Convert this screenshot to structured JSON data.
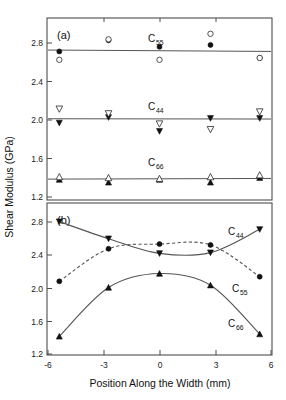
{
  "figure": {
    "ylabel": "Shear Modulus (GPa)",
    "xlabel": "Position Along the Width (mm)",
    "panel_a_label": "(a)",
    "panel_b_label": "(b)",
    "ytick_labels": [
      "2.8",
      "2.4",
      "2.0",
      "1.6",
      "1.2"
    ],
    "ytick_values": [
      2.8,
      2.4,
      2.0,
      1.6,
      1.2
    ],
    "xtick_labels": [
      "-6",
      "-3",
      "0",
      "3",
      "6"
    ],
    "xtick_values": [
      -6,
      -3,
      0,
      3,
      6
    ],
    "series_names": {
      "c55_base": "C",
      "c55_sub": "55",
      "c44_base": "C",
      "c44_sub": "44",
      "c66_base": "C",
      "c66_sub": "66"
    },
    "colors": {
      "axis": "#4d4d4d",
      "line": "#555555",
      "marker_filled": "#111111",
      "marker_open_fill": "#ffffff",
      "marker_open_stroke": "#333333",
      "background": "#ffffff"
    }
  },
  "chart_data": [
    {
      "type": "scatter",
      "panel": "(a)",
      "title": "",
      "xlabel": "",
      "ylabel": "Shear Modulus (GPa)",
      "xlim": [
        -6.4,
        6.4
      ],
      "ylim": [
        1.02,
        2.98
      ],
      "grid": false,
      "legend_position": "inline-annotations",
      "annotations": [
        "(a)",
        "C55",
        "C44",
        "C66"
      ],
      "x": [
        -5.7,
        -2.9,
        0.0,
        2.9,
        5.7
      ],
      "series": [
        {
          "name": "C55 filled",
          "marker": "filled-circle",
          "values": [
            2.62,
            2.74,
            2.67,
            2.69,
            2.55
          ]
        },
        {
          "name": "C55 open",
          "marker": "open-circle",
          "values": [
            2.53,
            2.75,
            2.53,
            2.81,
            2.55
          ]
        },
        {
          "name": "C55 fit",
          "marker": "line",
          "values": [
            2.635,
            2.63,
            2.627,
            2.624,
            2.62
          ]
        },
        {
          "name": "C44 filled",
          "marker": "filled-down-triangle",
          "values": [
            1.85,
            1.91,
            1.76,
            1.9,
            1.9
          ]
        },
        {
          "name": "C44 open",
          "marker": "open-down-triangle",
          "values": [
            2.0,
            1.95,
            1.84,
            1.78,
            1.97
          ]
        },
        {
          "name": "C44 fit",
          "marker": "line",
          "values": [
            1.895,
            1.895,
            1.894,
            1.893,
            1.892
          ]
        },
        {
          "name": "C66 filled",
          "marker": "filled-up-triangle",
          "values": [
            1.24,
            1.21,
            1.24,
            1.21,
            1.26
          ]
        },
        {
          "name": "C66 open",
          "marker": "open-up-triangle",
          "values": [
            1.27,
            1.26,
            1.25,
            1.27,
            1.29
          ]
        },
        {
          "name": "C66 fit",
          "marker": "line",
          "values": [
            1.245,
            1.247,
            1.248,
            1.25,
            1.252
          ]
        }
      ]
    },
    {
      "type": "line",
      "panel": "(b)",
      "title": "",
      "xlabel": "Position Along the Width (mm)",
      "ylabel": "Shear Modulus (GPa)",
      "xlim": [
        -6.4,
        6.4
      ],
      "ylim": [
        1.02,
        2.98
      ],
      "grid": false,
      "legend_position": "inline-annotations",
      "annotations": [
        "(b)",
        "C44",
        "C55",
        "C66"
      ],
      "x": [
        -5.7,
        -2.9,
        0.0,
        2.9,
        5.7
      ],
      "series": [
        {
          "name": "C44",
          "marker": "filled-down-triangle",
          "linestyle": "solid",
          "values": [
            2.74,
            2.52,
            2.33,
            2.34,
            2.64
          ]
        },
        {
          "name": "C55",
          "marker": "filled-circle",
          "linestyle": "dashed",
          "values": [
            1.97,
            2.39,
            2.45,
            2.44,
            2.03
          ]
        },
        {
          "name": "C66",
          "marker": "filled-up-triangle",
          "linestyle": "solid",
          "values": [
            1.26,
            1.89,
            2.07,
            1.92,
            1.29
          ]
        }
      ]
    }
  ]
}
